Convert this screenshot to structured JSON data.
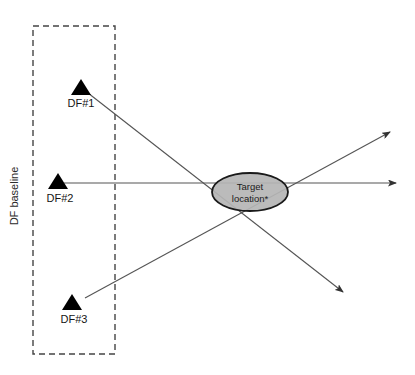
{
  "figure": {
    "type": "schematic-diagram",
    "background_color": "#ffffff",
    "line_color": "#555555",
    "marker_color": "#000000",
    "width": 415,
    "height": 375
  },
  "baseline": {
    "label": "DF baseline",
    "label_rotation_deg": -90,
    "box_style": "dashed",
    "box_color": "#444444",
    "box": {
      "x": 33,
      "y": 26,
      "width": 82,
      "height": 328
    }
  },
  "stations": [
    {
      "id": "df1",
      "label": "DF#1",
      "marker": "triangle",
      "marker_color": "#000000",
      "position": {
        "x": 81,
        "y": 88
      },
      "label_position": {
        "x": 81,
        "y": 104
      }
    },
    {
      "id": "df2",
      "label": "DF#2",
      "marker": "triangle",
      "marker_color": "#000000",
      "position": {
        "x": 58,
        "y": 182
      },
      "label_position": {
        "x": 60,
        "y": 199
      }
    },
    {
      "id": "df3",
      "label": "DF#3",
      "marker": "triangle",
      "marker_color": "#000000",
      "position": {
        "x": 72,
        "y": 303
      },
      "label_position": {
        "x": 74,
        "y": 320
      }
    }
  ],
  "target": {
    "label_line1": "Target",
    "label_line2": "location*",
    "shape": "ellipse",
    "fill_color": "#b5b5b5",
    "stroke_color": "#1a1a1a",
    "center": {
      "x": 250,
      "y": 192
    },
    "radius_x": 38,
    "radius_y": 19
  },
  "bearing_lines": [
    {
      "id": "bearing-df1",
      "from_station": "DF#1",
      "start": {
        "x": 88,
        "y": 93
      },
      "end": {
        "x": 343,
        "y": 292
      },
      "arrowhead": "end",
      "direction": "down-right"
    },
    {
      "id": "bearing-df2",
      "from_station": "DF#2",
      "start": {
        "x": 64,
        "y": 183
      },
      "end": {
        "x": 396,
        "y": 183
      },
      "arrowhead": "end",
      "direction": "right"
    },
    {
      "id": "bearing-df3",
      "from_station": "DF#3",
      "start": {
        "x": 85,
        "y": 298
      },
      "end": {
        "x": 390,
        "y": 132
      },
      "arrowhead": "end",
      "direction": "up-right"
    }
  ],
  "intersection": {
    "x": 250,
    "y": 214
  }
}
